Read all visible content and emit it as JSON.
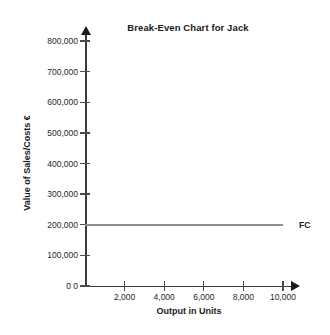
{
  "chart_data": {
    "type": "line",
    "title": "Break-Even Chart for Jack",
    "xlabel": "Output in Units",
    "ylabel": "Value of Sales/Costs €",
    "xlim": [
      0,
      10000
    ],
    "ylim": [
      0,
      800000
    ],
    "grid": false,
    "legend_position": "right-of-line-end",
    "x_ticks": [
      {
        "value": 0,
        "label": "0"
      },
      {
        "value": 2000,
        "label": "2,000"
      },
      {
        "value": 4000,
        "label": "4,000"
      },
      {
        "value": 6000,
        "label": "6,000"
      },
      {
        "value": 8000,
        "label": "8,000"
      },
      {
        "value": 10000,
        "label": "10,000"
      }
    ],
    "y_ticks": [
      {
        "value": 0,
        "label": "0"
      },
      {
        "value": 100000,
        "label": "100,000"
      },
      {
        "value": 200000,
        "label": "200,000"
      },
      {
        "value": 300000,
        "label": "300,000"
      },
      {
        "value": 400000,
        "label": "400,000"
      },
      {
        "value": 500000,
        "label": "500,000"
      },
      {
        "value": 600000,
        "label": "600,000"
      },
      {
        "value": 700000,
        "label": "700,000"
      },
      {
        "value": 800000,
        "label": "800,000"
      }
    ],
    "series": [
      {
        "name": "FC",
        "label": "FC",
        "color": "#8d8d8d",
        "x": [
          0,
          10000
        ],
        "values": [
          200000,
          200000
        ]
      }
    ]
  }
}
